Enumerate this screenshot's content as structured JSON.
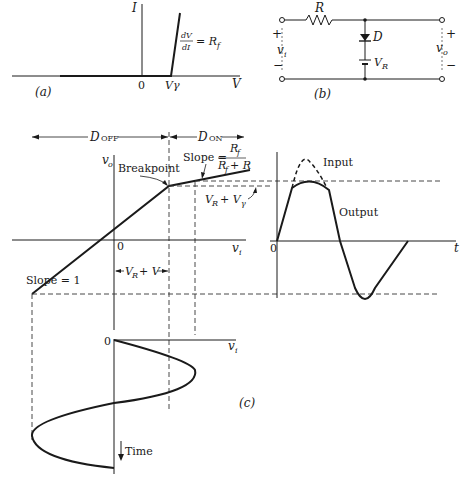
{
  "panel_a": {
    "label": "(a)",
    "y_axis": "I",
    "x_axis": "V",
    "origin": "0",
    "threshold": "Vγ",
    "slope_num": "dV",
    "slope_den": "dI",
    "slope_eq": "= R",
    "slope_sub": "f"
  },
  "panel_b": {
    "label": "(b)",
    "resistor": "R",
    "diode": "D",
    "battery": "V",
    "battery_sub": "R",
    "input": "v",
    "input_sub": "i",
    "output": "v",
    "output_sub": "o",
    "plus": "+",
    "minus": "−"
  },
  "panel_c": {
    "label": "(c)",
    "d_off": "D",
    "d_off_suffix": "OFF",
    "d_on": "D",
    "d_on_suffix": "ON",
    "y_axis": "v",
    "y_axis_sub": "o",
    "x_axis": "v",
    "x_axis_sub": "i",
    "origin": "0",
    "breakpoint": "Breakpoint",
    "slope_label": "Slope =",
    "slope_num": "R",
    "slope_num_sub": "f",
    "slope_den": "R",
    "slope_den_sub": "f",
    "slope_den_rest": "+ R",
    "vr_vg": "V",
    "vr_sub": "R",
    "vr_plus": "+ V",
    "vg_sub": "γ",
    "slope_one": "Slope = 1",
    "time_label": "Time",
    "wave_t": "t",
    "wave_origin": "0",
    "input_label": "Input",
    "output_label": "Output",
    "lower_origin": "0",
    "lower_axis": "v",
    "lower_axis_sub": "i"
  }
}
